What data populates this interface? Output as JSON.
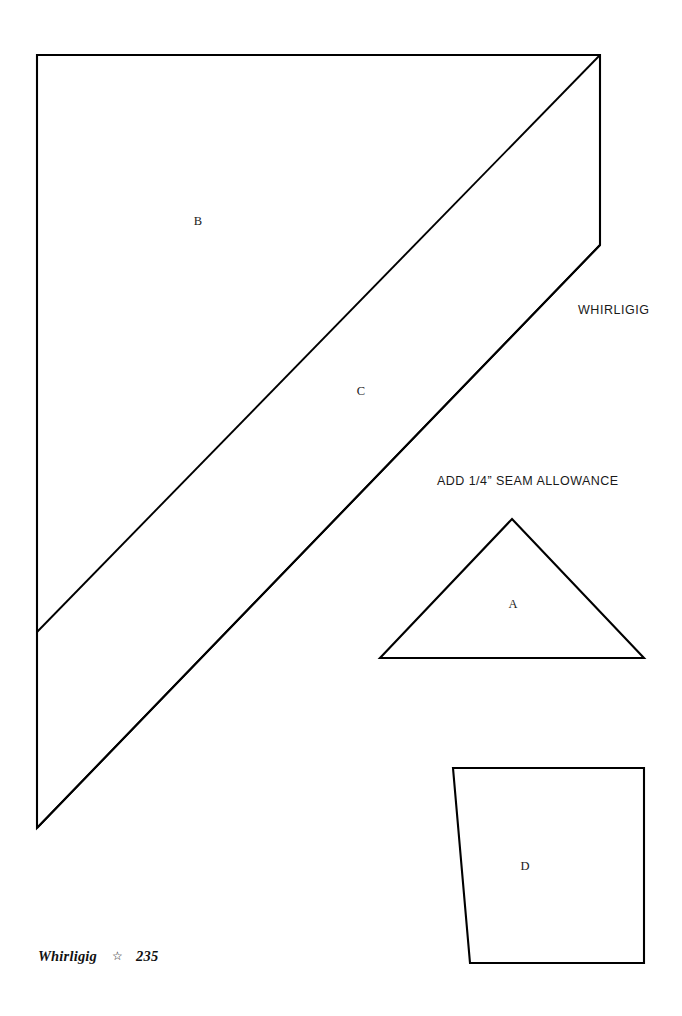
{
  "page": {
    "background_color": "#ffffff",
    "line_color": "#000000",
    "width": 682,
    "height": 1016
  },
  "title": {
    "text": "WHIRLIGIG",
    "x": 578,
    "y": 303
  },
  "note": {
    "text": "ADD 1/4” SEAM ALLOWANCE",
    "x": 437,
    "y": 474
  },
  "footer": {
    "book_title": "Whirligig",
    "separator_icon": "star-icon",
    "separator": "☆",
    "page_number": "235"
  },
  "pieces": [
    {
      "id": "piece-b",
      "label": "B",
      "label_x": 198,
      "label_y": 221,
      "outline": "M 37,55 L 600,55 L 600,245 L 37,632 Z",
      "description": "large upper triangle-quadrilateral template piece"
    },
    {
      "id": "piece-c",
      "label": "C",
      "label_x": 361,
      "label_y": 391,
      "outline": "M 37,632 L 600,245 L 600,245",
      "description": "diagonal band template piece between B and lower triangle"
    },
    {
      "id": "piece-a",
      "label": "A",
      "label_x": 513,
      "label_y": 604,
      "outline": "M 512,519 L 644,658 L 380,658 Z",
      "description": "small isosceles triangle template piece"
    },
    {
      "id": "piece-d",
      "label": "D",
      "label_x": 525,
      "label_y": 866,
      "outline": "M 453,768 L 644,768 L 644,963 L 470,963 Z",
      "description": "trapezoid template piece with slanted left edge"
    }
  ],
  "geometry": {
    "big_shape_outline": "M 37,55 L 600,55 L 600,245 L 37,828 Z",
    "band_divider_upper": "M 600,55 L 37,632",
    "band_divider_lower": "M 600,245 L 37,828",
    "triangle_a": "M 512,519 L 644,658 L 380,658 Z",
    "trapezoid_d": "M 453,768 L 644,768 L 644,963 L 470,963 Z"
  }
}
